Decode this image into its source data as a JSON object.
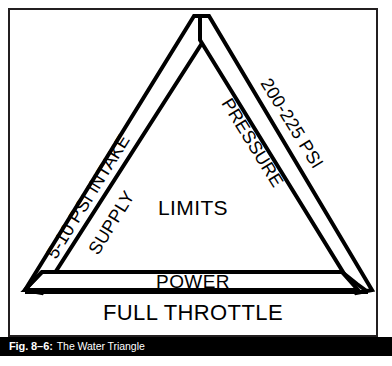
{
  "figure": {
    "caption_number": "Fig. 8–6:",
    "caption_title": "The Water Triangle",
    "caption_bar_color": "#000000",
    "caption_text_color": "#ffffff",
    "ink_color": "#000000",
    "border_color": "#231f20",
    "background_color": "#ffffff"
  },
  "diagram": {
    "type": "triangle-concept-diagram",
    "center_label": "LIMITS",
    "base_inner_label": "POWER",
    "base_outer_label": "FULL THROTTLE",
    "left_side": {
      "outer_label": "5-10 PSI INTAKE",
      "inner_label": "SUPPLY"
    },
    "right_side": {
      "outer_label": "200-225 PSI",
      "inner_label": "PRESSURE"
    }
  },
  "bleed": {
    "partial_text": ""
  }
}
